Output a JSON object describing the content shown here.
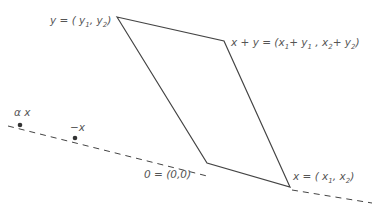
{
  "diagram": {
    "type": "parallelogram-vector-addition",
    "colors": {
      "line": "#444444",
      "text": "#555555",
      "background": "#ffffff"
    },
    "vertices": {
      "origin": {
        "label": "0 = (0,0)"
      },
      "x": {
        "label": "x = (x1, x2)"
      },
      "y": {
        "label": "y = ( y1, y2)"
      },
      "x_plus_y": {
        "label": "x + y = (x1+y1 , x2+y2)"
      }
    },
    "line_points": {
      "alpha_x": {
        "label": "α x"
      },
      "minus_x": {
        "label": "−x"
      }
    },
    "dashed_line": {
      "description": "line through 0 and x"
    }
  }
}
